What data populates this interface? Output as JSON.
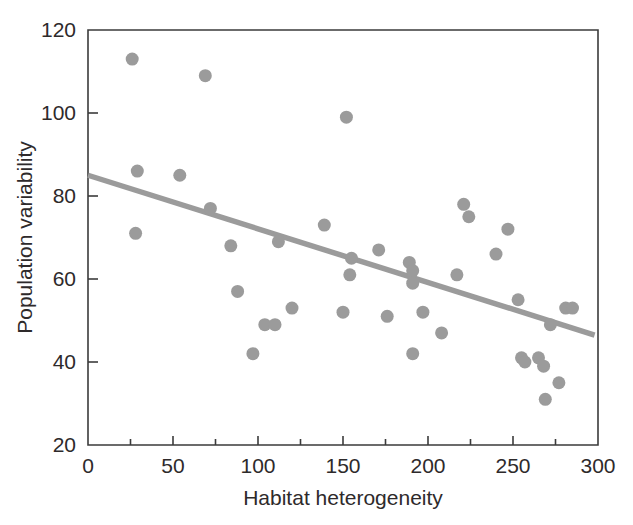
{
  "chart_data": {
    "type": "scatter",
    "title": "",
    "xlabel": "Habitat heterogeneity",
    "ylabel": "Population variability",
    "xlim": [
      0,
      300
    ],
    "ylim": [
      20,
      120
    ],
    "xticks": [
      0,
      50,
      100,
      150,
      200,
      250,
      300
    ],
    "xticklabels": [
      "0",
      "50",
      "100",
      "150",
      "200",
      "250",
      "300"
    ],
    "xminorticks": [
      25,
      75,
      125,
      175,
      225,
      275
    ],
    "yticks": [
      20,
      40,
      60,
      80,
      100,
      120
    ],
    "yticklabels": [
      "20",
      "40",
      "60",
      "80",
      "100",
      "120"
    ],
    "grid": false,
    "legend": null,
    "marker": {
      "shape": "circle",
      "color": "#9b9b9b",
      "size": 13
    },
    "series": [
      {
        "name": "observations",
        "points": [
          [
            26,
            113
          ],
          [
            29,
            86
          ],
          [
            28,
            71
          ],
          [
            54,
            85
          ],
          [
            69,
            109
          ],
          [
            72,
            77
          ],
          [
            84,
            68
          ],
          [
            88,
            57
          ],
          [
            97,
            42
          ],
          [
            104,
            49
          ],
          [
            110,
            49
          ],
          [
            112,
            69
          ],
          [
            120,
            53
          ],
          [
            139,
            73
          ],
          [
            152,
            99
          ],
          [
            150,
            52
          ],
          [
            155,
            65
          ],
          [
            154,
            61
          ],
          [
            171,
            67
          ],
          [
            176,
            51
          ],
          [
            189,
            64
          ],
          [
            191,
            62
          ],
          [
            191,
            59
          ],
          [
            191,
            42
          ],
          [
            197,
            52
          ],
          [
            208,
            47
          ],
          [
            217,
            61
          ],
          [
            221,
            78
          ],
          [
            224,
            75
          ],
          [
            240,
            66
          ],
          [
            247,
            72
          ],
          [
            253,
            55
          ],
          [
            255,
            41
          ],
          [
            257,
            40
          ],
          [
            265,
            41
          ],
          [
            268,
            39
          ],
          [
            269,
            31
          ],
          [
            272,
            49
          ],
          [
            277,
            35
          ],
          [
            281,
            53
          ],
          [
            285,
            53
          ]
        ]
      }
    ],
    "trendline": {
      "type": "linear-fit",
      "color": "#9b9b9b",
      "x_start": 0,
      "y_start": 85,
      "x_end": 298,
      "y_end": 46.5
    }
  }
}
